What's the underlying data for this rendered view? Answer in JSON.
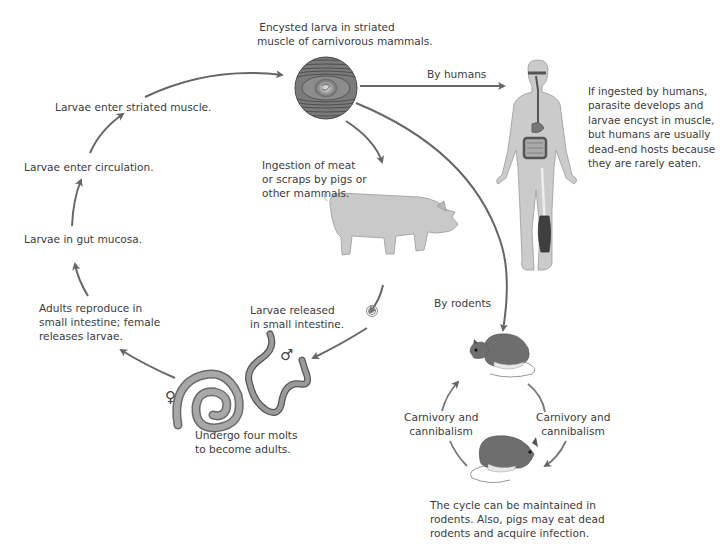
{
  "diagram": {
    "colors": {
      "arrow": "#666666",
      "figure_fill": "#c8c8c8",
      "figure_stroke": "#8a8a8a",
      "dark_organ": "#555555",
      "rodent_fill": "#6e6e6e",
      "text": "#3b3b3b"
    },
    "main_cycle": {
      "encysted": {
        "line1": "Encysted larva in striated",
        "line2": "muscle of carnivorous mammals."
      },
      "enter_muscle": "Larvae enter striated muscle.",
      "enter_circulation": "Larvae enter circulation.",
      "gut_mucosa": "Larvae in gut mucosa.",
      "adults_reproduce": {
        "line1": "Adults reproduce in",
        "line2": "small intestine; female",
        "line3": "releases larvae."
      },
      "molts": {
        "line1": "Undergo four molts",
        "line2": "to become adults."
      },
      "released": {
        "line1": "Larvae released",
        "line2": "in small intestine."
      },
      "ingestion": {
        "line1": "Ingestion of meat",
        "line2": "or scraps by pigs or",
        "line3": "other mammals."
      },
      "female_symbol": "♀",
      "male_symbol": "♂"
    },
    "human_branch": {
      "arrow_label": "By humans",
      "note": {
        "line1": "If ingested by humans,",
        "line2": "parasite develops and",
        "line3": "larvae encyst in muscle,",
        "line4": "but humans are usually",
        "line5": "dead-end hosts because",
        "line6": "they are rarely  eaten."
      }
    },
    "rodent_branch": {
      "arrow_label": "By rodents",
      "left_label": {
        "line1": "Carnivory and",
        "line2": "cannibalism"
      },
      "right_label": {
        "line1": "Carnivory and",
        "line2": "cannibalism"
      },
      "note": {
        "line1": "The cycle can be maintained in",
        "line2": "rodents. Also, pigs may eat dead",
        "line3": "rodents and acquire infection."
      }
    },
    "icons": [
      "muscle-cyst-icon",
      "pig-icon",
      "human-body-icon",
      "coiled-larva-icon",
      "female-worm-icon",
      "male-worm-icon",
      "rodent-icon"
    ]
  }
}
